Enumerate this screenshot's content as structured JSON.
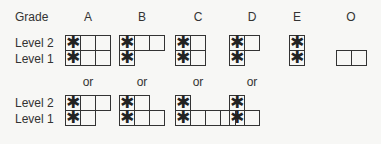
{
  "header": {
    "label": "Grade",
    "grades": [
      "A",
      "B",
      "C",
      "D",
      "E",
      "O"
    ]
  },
  "row_labels": {
    "level2": "Level 2",
    "level1": "Level 1"
  },
  "separator_label": "or",
  "star_glyph": "✱",
  "layout": {
    "grade_x": [
      88,
      142,
      198,
      252,
      297,
      351
    ],
    "or_x": [
      88,
      142,
      198,
      252
    ],
    "cell": 16
  },
  "primary_patterns": [
    {
      "grade": "A",
      "x": 65,
      "level2": {
        "cells": 3,
        "starred": 1
      },
      "level1": {
        "cells": 3,
        "starred": 1
      }
    },
    {
      "grade": "B",
      "x": 119,
      "level2": {
        "cells": 3,
        "starred": 1
      },
      "level1": {
        "cells": 1,
        "starred": 1
      }
    },
    {
      "grade": "C",
      "x": 175,
      "level2": {
        "cells": 2,
        "starred": 1
      },
      "level1": {
        "cells": 2,
        "starred": 1
      }
    },
    {
      "grade": "D",
      "x": 229,
      "level2": {
        "cells": 2,
        "starred": 1
      },
      "level1": {
        "cells": 1,
        "starred": 1
      }
    },
    {
      "grade": "E",
      "x": 289,
      "level2": {
        "cells": 1,
        "starred": 1
      },
      "level1": {
        "cells": 1,
        "starred": 1
      }
    },
    {
      "grade": "O",
      "x": 336,
      "level2": {
        "cells": 0,
        "starred": 0
      },
      "level1": {
        "cells": 2,
        "starred": 0
      }
    }
  ],
  "alternative_patterns": [
    {
      "grade": "A",
      "x": 65,
      "level2": {
        "cells": 3,
        "starred": 1
      },
      "level1": {
        "cells": 2,
        "starred": 1
      }
    },
    {
      "grade": "B",
      "x": 119,
      "level2": {
        "cells": 2,
        "starred": 1
      },
      "level1": {
        "cells": 3,
        "starred": 1
      }
    },
    {
      "grade": "C",
      "x": 175,
      "level2": {
        "cells": 1,
        "starred": 1
      },
      "level1": {
        "cells": 4,
        "starred": 1
      }
    },
    {
      "grade": "D",
      "x": 229,
      "level2": {
        "cells": 1,
        "starred": 1
      },
      "level1": {
        "cells": 2,
        "starred": 1
      }
    }
  ]
}
